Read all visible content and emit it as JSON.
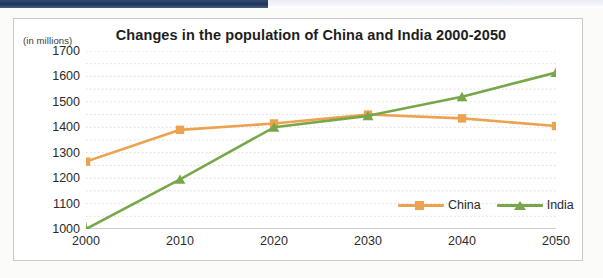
{
  "page": {
    "band_color": "#23375c"
  },
  "chart_data": {
    "type": "line",
    "title": "Changes in the population of China and India 2000-2050",
    "subtitle": "",
    "unit_label": "(in millions)",
    "xlabel": "",
    "ylabel": "",
    "x": [
      2000,
      2010,
      2020,
      2030,
      2040,
      2050
    ],
    "categories": [
      "2000",
      "2010",
      "2020",
      "2030",
      "2040",
      "2050"
    ],
    "series": [
      {
        "name": "China",
        "color": "#eda24f",
        "marker": "square",
        "values": [
          1265,
          1390,
          1415,
          1450,
          1435,
          1405
        ]
      },
      {
        "name": "India",
        "color": "#76a84b",
        "marker": "triangle",
        "values": [
          1000,
          1195,
          1400,
          1445,
          1520,
          1615
        ]
      }
    ],
    "ylim": [
      1000,
      1700
    ],
    "ytick_values": [
      1000,
      1100,
      1200,
      1300,
      1400,
      1500,
      1600,
      1700
    ],
    "ytick_labels": [
      "1000",
      "1100",
      "1200",
      "1300",
      "1400",
      "1500",
      "1600",
      "1700"
    ],
    "minor_ytick_values": [
      1050,
      1150,
      1250,
      1350,
      1450,
      1550,
      1650
    ],
    "xlim": [
      2000,
      2050
    ],
    "grid": true,
    "grid_style": "dotted-horizontal",
    "grid_color": "#ded7d2",
    "legend_position": "inside-bottom-right",
    "legend_entries": [
      "China",
      "India"
    ]
  }
}
